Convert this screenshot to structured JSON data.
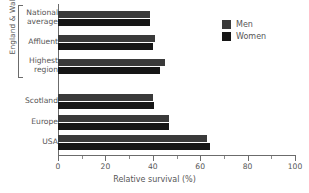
{
  "chart_data": {
    "type": "bar",
    "orientation": "horizontal",
    "title": "",
    "xlabel": "Relative survival (%)",
    "ylabel": "",
    "xlim": [
      0,
      100
    ],
    "grid": false,
    "legend_position": "top-right",
    "categories": [
      "National average",
      "Affluent",
      "Highest region",
      "Scotland",
      "Europe",
      "USA"
    ],
    "category_lines": [
      [
        "National",
        "average"
      ],
      [
        "Affluent"
      ],
      [
        "Highest",
        "region"
      ],
      [
        "Scotland"
      ],
      [
        "Europe"
      ],
      [
        "USA"
      ]
    ],
    "series": [
      {
        "name": "Men",
        "color": "#3a3a3a",
        "values": [
          39,
          41,
          45,
          40,
          47,
          63
        ]
      },
      {
        "name": "Women",
        "color": "#161616",
        "values": [
          39,
          40,
          43,
          40.5,
          47,
          64
        ]
      }
    ],
    "group_bracket_label": "England & Wales",
    "group_bracket_categories": [
      "National average",
      "Affluent",
      "Highest region"
    ],
    "x_ticks_major": [
      0,
      20,
      40,
      60,
      80,
      100
    ],
    "x_tick_labels": [
      "0",
      "20",
      "40",
      "60",
      "80",
      "100"
    ],
    "x_ticks_minor": [
      10,
      30,
      50,
      70,
      90
    ]
  },
  "legend": {
    "items": [
      {
        "label": "Men",
        "swatch": "men-swatch"
      },
      {
        "label": "Women",
        "swatch": "women-swatch"
      }
    ]
  },
  "axis": {
    "x_title": "Relative survival (%)"
  }
}
